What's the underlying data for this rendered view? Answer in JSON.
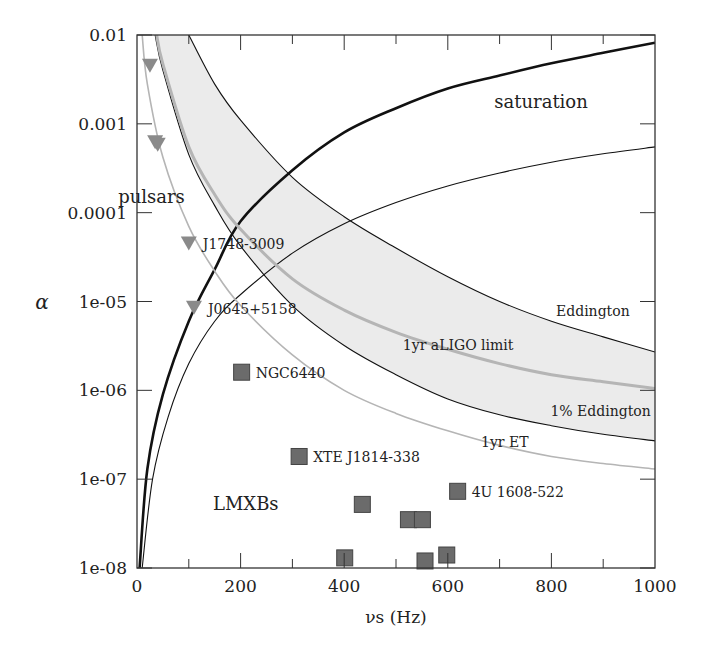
{
  "chart_data": {
    "type": "line",
    "title": "",
    "xlabel": "νs (Hz)",
    "ylabel": "α",
    "xlim": [
      0,
      1000
    ],
    "ylim": [
      1e-08,
      0.01
    ],
    "yscale": "log",
    "grid": false,
    "x_ticks": [
      0,
      200,
      400,
      600,
      800,
      1000
    ],
    "x_tick_labels": [
      "0",
      "200",
      "400",
      "600",
      "800",
      "1000"
    ],
    "y_ticks": [
      1e-08,
      1e-07,
      1e-06,
      1e-05,
      0.0001,
      0.001,
      0.01
    ],
    "y_tick_labels": [
      "1e-08",
      "1e-07",
      "1e-06",
      "1e-05",
      "0.0001",
      "0.001",
      "0.01"
    ],
    "region_labels": [
      {
        "text": "saturation",
        "x": 780,
        "y": 0.0015
      },
      {
        "text": "pulsars",
        "x": 28,
        "y": 0.00013
      },
      {
        "text": "LMXBs",
        "x": 210,
        "y": 4.5e-08
      }
    ],
    "series": [
      {
        "name": "saturation",
        "style": "thick-black",
        "x": [
          5,
          20,
          50,
          100,
          150,
          200,
          300,
          400,
          500,
          600,
          700,
          800,
          900,
          1000
        ],
        "y": [
          1e-08,
          1.3e-07,
          9e-07,
          6e-06,
          2.3e-05,
          8e-05,
          0.0003,
          0.0008,
          0.0015,
          0.0025,
          0.0035,
          0.0048,
          0.0063,
          0.0082
        ]
      },
      {
        "name": "1yr ET",
        "label": "1yr ET",
        "style": "thin-black",
        "x": [
          10,
          30,
          60,
          100,
          150,
          200,
          300,
          400,
          500,
          600,
          700,
          800,
          900,
          1000
        ],
        "y": [
          1e-08,
          1e-07,
          5e-07,
          2e-06,
          6e-06,
          1.2e-05,
          3.5e-05,
          7.5e-05,
          0.00013,
          0.0002,
          0.00028,
          0.00037,
          0.00046,
          0.00055
        ]
      },
      {
        "name": "Eddington",
        "label": "Eddington",
        "style": "thin-black",
        "x": [
          100,
          150,
          200,
          300,
          400,
          500,
          600,
          700,
          800,
          900,
          1000
        ],
        "y": [
          0.01,
          0.0028,
          0.0011,
          0.00025,
          9e-05,
          4e-05,
          1.9e-05,
          1e-05,
          6e-06,
          4e-06,
          2.7e-06
        ]
      },
      {
        "name": "1% Eddington",
        "label": "1% Eddington",
        "style": "thin-black",
        "x": [
          35,
          50,
          100,
          150,
          200,
          300,
          400,
          500,
          600,
          700,
          800,
          900,
          1000
        ],
        "y": [
          0.01,
          0.004,
          0.00045,
          0.00012,
          4.2e-05,
          9e-06,
          3.2e-06,
          1.5e-06,
          8e-07,
          5.3e-07,
          4e-07,
          3.2e-07,
          2.7e-07
        ]
      },
      {
        "name": "1yr aLIGO limit",
        "label": "1yr aLIGO limit",
        "style": "thick-gray",
        "x": [
          38,
          50,
          100,
          150,
          200,
          300,
          400,
          500,
          600,
          700,
          800,
          900,
          1000
        ],
        "y": [
          0.01,
          0.0047,
          0.00055,
          0.00016,
          6.5e-05,
          1.8e-05,
          8e-06,
          4.5e-06,
          2.9e-06,
          2e-06,
          1.5e-06,
          1.25e-06,
          1.05e-06
        ]
      },
      {
        "name": "1yr ET sensitivity",
        "label": "1yr ET",
        "style": "thin-gray",
        "x": [
          10,
          20,
          50,
          100,
          150,
          200,
          300,
          400,
          500,
          600,
          700,
          800,
          900,
          1000
        ],
        "y": [
          0.01,
          0.0028,
          0.00042,
          7e-05,
          2.2e-05,
          9e-06,
          2.5e-06,
          1e-06,
          5.5e-07,
          3.5e-07,
          2.4e-07,
          1.8e-07,
          1.5e-07,
          1.3e-07
        ]
      }
    ],
    "band": {
      "upper": "Eddington",
      "lower": "1% Eddington",
      "fill": "#ebebeb"
    },
    "pulsars": [
      {
        "x": 25,
        "y": 0.0045,
        "label": ""
      },
      {
        "x": 35,
        "y": 0.00062,
        "label": ""
      },
      {
        "x": 40,
        "y": 0.00058,
        "label": ""
      },
      {
        "x": 100,
        "y": 4.5e-05,
        "label": "J1748-3009"
      },
      {
        "x": 110,
        "y": 8.5e-06,
        "label": "J0645+5158"
      }
    ],
    "lmxbs": [
      {
        "x": 202,
        "y": 1.6e-06,
        "label": "NGC6440"
      },
      {
        "x": 313,
        "y": 1.8e-07,
        "label": "XTE J1814-338"
      },
      {
        "x": 435,
        "y": 5.2e-08,
        "label": ""
      },
      {
        "x": 524,
        "y": 3.5e-08,
        "label": ""
      },
      {
        "x": 551,
        "y": 3.5e-08,
        "label": ""
      },
      {
        "x": 619,
        "y": 7.3e-08,
        "label": "4U 1608-522"
      },
      {
        "x": 401,
        "y": 1.3e-08,
        "label": ""
      },
      {
        "x": 556,
        "y": 1.2e-08,
        "label": ""
      },
      {
        "x": 598,
        "y": 1.4e-08,
        "label": ""
      }
    ],
    "colors": {
      "axis": "#333333",
      "black_curve": "#111111",
      "gray_curve": "#b5b5b5",
      "marker": "#6b6b6b",
      "marker_edge": "#444444",
      "band": "#ebebeb"
    }
  }
}
